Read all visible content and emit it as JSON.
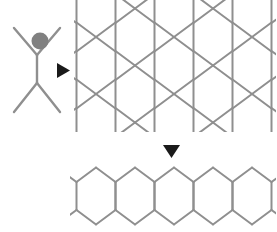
{
  "figure": {
    "title": "Monomer self-assembly into hexagonal lattice and linear strip",
    "background_color": "#ffffff",
    "width": 276,
    "height": 232,
    "line_color": "#8f8f8f",
    "arrow_color": "#1a1a1a",
    "head_color": "#808080"
  },
  "monomer": {
    "label": "monomer-unit",
    "description": "X-shaped monomer with two upper arms, a vertical stem, two lower legs, and a gray circular head",
    "center_x": 37,
    "stem_top_y": 55,
    "stem_bottom_y": 83,
    "arm_span": 23,
    "arm_rise": 27,
    "leg_span": 23,
    "leg_drop": 29,
    "head": {
      "label": "head-group",
      "cx": 40,
      "cy": 41,
      "r": 8.5,
      "color": "#808080"
    }
  },
  "arrow_right": {
    "label": "assembly-arrow-right",
    "glyph": "triangle-right",
    "x": 57,
    "y": 63,
    "width": 13,
    "height": 15
  },
  "arrow_down": {
    "label": "assembly-arrow-down",
    "glyph": "triangle-down",
    "x": 163,
    "y": 145,
    "width": 17,
    "height": 13
  },
  "lattice_2d": {
    "label": "hexagonal-lattice-2d",
    "description": "Two-dimensional honeycomb lattice of vertically elongated hexagons, clipped at the left and bottom edges",
    "origin_x": 57,
    "origin_y": -20,
    "hex_half_width": 19.5,
    "hex_vertical_side": 28,
    "hex_cap_rise": 14.5,
    "columns": 6,
    "rows": 3,
    "clip": {
      "x": 74,
      "y": 0,
      "width": 202,
      "height": 132
    }
  },
  "strip_1d": {
    "label": "hexagonal-strip-1d",
    "description": "One-dimensional strip: a single row of edge-fused elongated hexagons with open stub bonds at both ends",
    "origin_x": 96,
    "origin_y": 196,
    "hex_half_width": 19.5,
    "hex_vertical_side": 28,
    "hex_cap_rise": 14.5,
    "count": 5,
    "stub_length": 14,
    "clip": {
      "x": 70,
      "y": 160,
      "width": 206,
      "height": 72
    }
  },
  "accessibility": {
    "monomer_alt": "Monomer building block",
    "lattice_alt": "Two-dimensional hexagonal lattice",
    "strip_alt": "One-dimensional hexagonal strip"
  }
}
